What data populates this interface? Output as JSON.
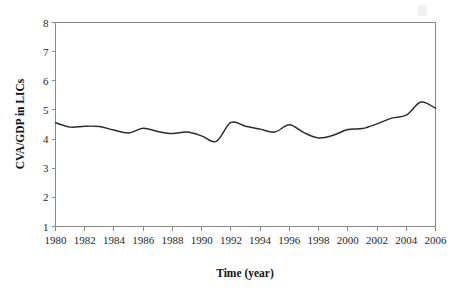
{
  "chart_data": {
    "type": "line",
    "title": "",
    "xlabel": "Time (year)",
    "ylabel": "CVA/GDP in LICs",
    "xlim": [
      1980,
      2006
    ],
    "ylim": [
      1,
      8
    ],
    "grid": false,
    "legend": null,
    "x_tick_labels": [
      "1980",
      "1982",
      "1984",
      "1986",
      "1988",
      "1990",
      "1992",
      "1994",
      "1996",
      "1998",
      "2000",
      "2002",
      "2004",
      "2006"
    ],
    "x_ticks": [
      1980,
      1982,
      1984,
      1986,
      1988,
      1990,
      1992,
      1994,
      1996,
      1998,
      2000,
      2002,
      2004,
      2006
    ],
    "y_tick_labels": [
      "1",
      "2",
      "3",
      "4",
      "5",
      "6",
      "7",
      "8"
    ],
    "y_ticks": [
      1,
      2,
      3,
      4,
      5,
      6,
      7,
      8
    ],
    "x": [
      1980,
      1981,
      1982,
      1983,
      1984,
      1985,
      1986,
      1987,
      1988,
      1989,
      1990,
      1991,
      1992,
      1993,
      1994,
      1995,
      1996,
      1997,
      1998,
      1999,
      2000,
      2001,
      2002,
      2003,
      2004,
      2005,
      2006
    ],
    "series": [
      {
        "name": "CVA/GDP in LICs",
        "color": "#2b2b2b",
        "values": [
          4.56,
          4.41,
          4.44,
          4.43,
          4.31,
          4.21,
          4.37,
          4.26,
          4.19,
          4.24,
          4.11,
          3.92,
          4.57,
          4.44,
          4.34,
          4.24,
          4.49,
          4.22,
          4.04,
          4.13,
          4.33,
          4.36,
          4.52,
          4.72,
          4.82,
          5.27,
          5.06
        ]
      }
    ]
  },
  "artifact": {
    "name": "scan-speck"
  }
}
